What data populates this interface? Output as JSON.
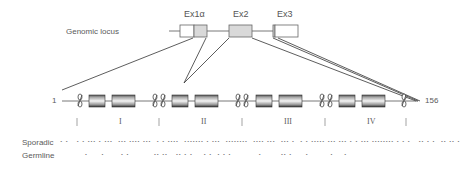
{
  "genomic_locus": {
    "label": "Genomic locus",
    "exons": [
      {
        "name": "Ex1α",
        "label": "Ex1α"
      },
      {
        "name": "Ex2",
        "label": "Ex2"
      },
      {
        "name": "Ex3",
        "label": "Ex3"
      }
    ]
  },
  "protein": {
    "start": "1",
    "end": "156",
    "repeats": [
      {
        "label": "I"
      },
      {
        "label": "II"
      },
      {
        "label": "III"
      },
      {
        "label": "IV"
      }
    ]
  },
  "mutations": {
    "sporadic_label": "Sporadic",
    "germline_label": "Germline",
    "sporadic_pattern": "• •   • • ••• • •••  ••• •••• •••  • • ••••  ••••••• • •••  ••••••••  •••• •••  ••• •  • • ••••• ••• ••• • • ••• •••••••• • • •   •• • •  •• •• •",
    "germline_pattern": "         •     •      • •         •• ••   •• • •    • •  • • •          •       •• •     •        •    •"
  },
  "colors": {
    "line": "#333333",
    "exon_fill": "#d9d9d9",
    "domain_dark": "#444444",
    "domain_light": "#f2f2f2"
  }
}
